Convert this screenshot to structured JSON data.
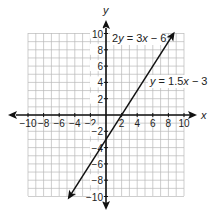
{
  "chart_data": {
    "type": "line",
    "title": "",
    "xlabel": "x",
    "ylabel": "y",
    "xlim": [
      -10,
      10
    ],
    "ylim": [
      -10,
      10
    ],
    "grid": true,
    "x_ticks": [
      -10,
      -8,
      -6,
      -4,
      -2,
      2,
      4,
      6,
      8,
      10
    ],
    "y_ticks": [
      -10,
      -8,
      -6,
      -4,
      -2,
      2,
      4,
      6,
      8,
      10
    ],
    "x_tick_labels": [
      "−10",
      "−8",
      "−6",
      "−4",
      "−2",
      "2",
      "4",
      "6",
      "8",
      "10"
    ],
    "y_tick_labels": [
      "−10",
      "−8",
      "−6",
      "−4",
      "−2",
      "2",
      "4",
      "6",
      "8",
      "10"
    ],
    "series": [
      {
        "name": "2y = 3x − 6",
        "equation": "y = 1.5x − 3",
        "slope": 1.5,
        "intercept": -3,
        "x": [
          -4.7,
          8.6
        ],
        "y": [
          -10.05,
          9.9
        ],
        "arrows": "both"
      }
    ],
    "annotations": [
      {
        "text_parts": [
          "2",
          "y",
          " = 3",
          "x",
          " − 6"
        ],
        "near": [
          5,
          10
        ]
      },
      {
        "text_parts": [
          "y",
          " = 1.5",
          "x",
          " − 3"
        ],
        "near": [
          7,
          5
        ]
      }
    ],
    "legend": "none",
    "colors": {
      "line": "#111111",
      "grid": "#b9b9b9",
      "axis": "#111111"
    }
  }
}
